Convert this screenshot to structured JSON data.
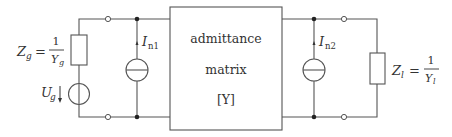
{
  "diagram": {
    "type": "two-port noise equivalent circuit",
    "box": {
      "line1": "admittance",
      "line2": "matrix",
      "line3": "[Y]"
    },
    "source_impedance": {
      "symbol": "Z",
      "sub": "g",
      "eq": "=",
      "num": "1",
      "den_symbol": "Y",
      "den_sub": "g"
    },
    "source_voltage": {
      "symbol": "U",
      "sub": "g"
    },
    "noise_current_1": {
      "symbol": "I",
      "sub": "n1"
    },
    "noise_current_2": {
      "symbol": "I",
      "sub": "n2"
    },
    "load_impedance": {
      "symbol": "Z",
      "sub": "l",
      "eq": "=",
      "num": "1",
      "den_symbol": "Y",
      "den_sub": "l"
    },
    "colors": {
      "wire": "#555555",
      "text": "#333333",
      "background": "#ffffff"
    }
  }
}
